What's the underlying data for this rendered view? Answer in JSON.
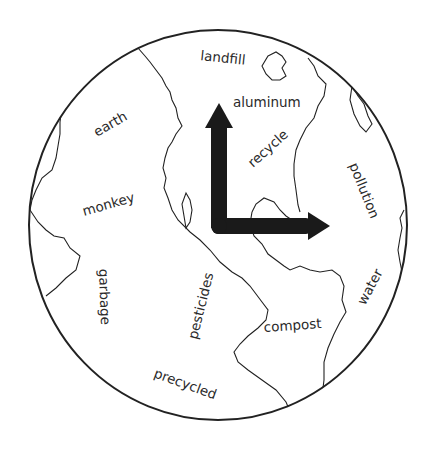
{
  "diagram": {
    "type": "globe-word-map",
    "globe": {
      "stroke": "#222222",
      "fill": "#ffffff"
    },
    "arrows": {
      "color": "#1a1a1a",
      "directions": [
        "up",
        "right"
      ]
    },
    "labels": [
      {
        "id": "landfill",
        "text": "landfill"
      },
      {
        "id": "aluminum",
        "text": "aluminum"
      },
      {
        "id": "earth",
        "text": "earth"
      },
      {
        "id": "recycle",
        "text": "recycle"
      },
      {
        "id": "pollution",
        "text": "pollution"
      },
      {
        "id": "monkey",
        "text": "monkey"
      },
      {
        "id": "garbage",
        "text": "garbage"
      },
      {
        "id": "pesticides",
        "text": "pesticides"
      },
      {
        "id": "water",
        "text": "water"
      },
      {
        "id": "compost",
        "text": "compost"
      },
      {
        "id": "precycled",
        "text": "precycled"
      }
    ]
  }
}
